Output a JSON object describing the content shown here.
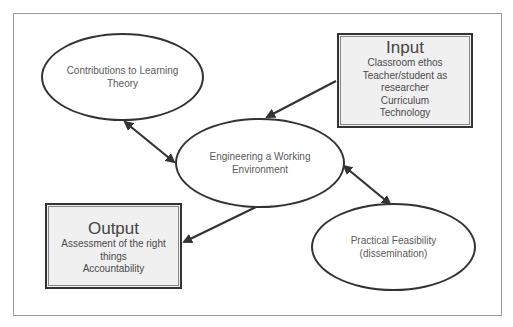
{
  "diagram": {
    "nodes": {
      "contributions": {
        "label": "Contributions to Learning Theory",
        "lines": [
          "Contributions to Learning",
          "Theory"
        ]
      },
      "engineering": {
        "label": "Engineering a Working Environment",
        "lines": [
          "Engineering a Working",
          "Environment"
        ]
      },
      "feasibility": {
        "label": "Practical Feasibility (dissemination)",
        "lines": [
          "Practical Feasibility",
          "(dissemination)"
        ]
      },
      "input": {
        "title": "Input",
        "lines": [
          "Classroom ethos",
          "Teacher/student as",
          "researcher",
          "Curriculum",
          "Technology"
        ]
      },
      "output": {
        "title": "Output",
        "lines": [
          "Assessment of the right",
          "things",
          "Accountability"
        ]
      }
    },
    "edges": [
      {
        "from": "input",
        "to": "engineering",
        "direction": "one-way"
      },
      {
        "from": "engineering",
        "to": "output",
        "direction": "one-way"
      },
      {
        "from": "contributions",
        "to": "engineering",
        "direction": "two-way"
      },
      {
        "from": "engineering",
        "to": "feasibility",
        "direction": "two-way"
      }
    ],
    "colors": {
      "stroke": "#333333",
      "box_fill": "#f0f0f0",
      "text": "#555555"
    }
  }
}
